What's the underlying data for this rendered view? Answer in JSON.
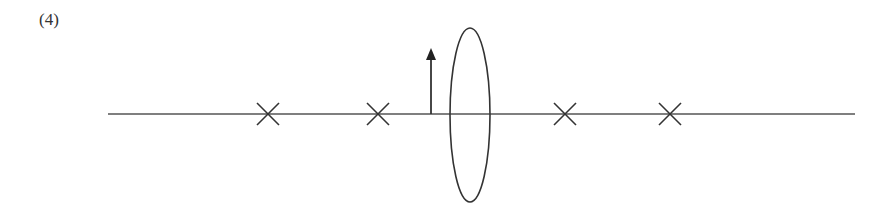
{
  "figure": {
    "label": "(4)",
    "colors": {
      "stroke": "#333333",
      "axis": "#555555",
      "background": "#ffffff"
    },
    "axis": {
      "x1": 108,
      "x2": 855,
      "y": 114
    },
    "lens": {
      "cx": 470,
      "cy": 115,
      "rx": 20,
      "ry": 87,
      "type": "convex"
    },
    "object_arrow": {
      "x": 431,
      "y_base": 114,
      "y_tip": 48
    },
    "focal_marks": [
      {
        "name": "2F-left",
        "x": 268
      },
      {
        "name": "F-left",
        "x": 378
      },
      {
        "name": "F-right",
        "x": 565
      },
      {
        "name": "2F-right",
        "x": 670
      }
    ]
  }
}
